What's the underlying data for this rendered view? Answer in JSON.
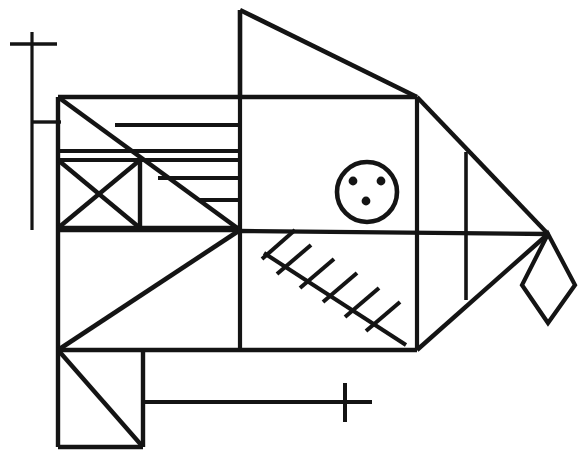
{
  "figure": {
    "title": "Fish line drawing",
    "canvas": {
      "width": 583,
      "height": 458,
      "background": "#ffffff"
    },
    "ink_color": "#141414",
    "stroke_width": 4.2,
    "thin_stroke_width": 3.2
  },
  "parts": {
    "mast": {
      "name": "vertical mast with crossbar",
      "vertical": [
        32,
        32,
        32,
        230
      ],
      "crossbar": [
        10,
        44,
        57,
        44
      ],
      "connector": [
        33,
        122,
        61,
        122
      ]
    },
    "dorsal_fin": {
      "name": "upper triangular fin",
      "vertical": [
        240,
        10,
        240,
        97
      ],
      "diagonal": [
        240,
        10,
        417,
        97
      ]
    },
    "eye": {
      "name": "circular eye",
      "cx": 367,
      "cy": 192,
      "r": 30,
      "dots": [
        {
          "cx": 353,
          "cy": 181,
          "r": 4.2
        },
        {
          "cx": 381,
          "cy": 181,
          "r": 4.2
        },
        {
          "cx": 366,
          "cy": 201,
          "r": 4.2
        }
      ]
    },
    "bone": {
      "name": "diagonal bone with ribs",
      "spine": [
        264,
        253,
        406,
        345
      ],
      "ribs": [
        [
          277,
          272,
          310,
          245
        ],
        [
          300,
          287,
          334,
          259
        ],
        [
          323,
          301,
          357,
          273
        ],
        [
          345,
          316,
          379,
          288
        ],
        [
          366,
          330,
          399,
          302
        ],
        [
          262,
          258,
          294,
          231
        ]
      ]
    },
    "tail": {
      "name": "diamond tail",
      "apex": [
        548,
        234
      ],
      "points": "548,234 573,284 548,322 523,284"
    },
    "marks": {
      "lower_cross": {
        "vertical": [
          345,
          383,
          345,
          422
        ],
        "horizontal": [
          319,
          402,
          372,
          402
        ]
      }
    },
    "body_outline": {
      "name": "main body polyline",
      "top_edge_y": 97,
      "left_edge_x": 58,
      "bottom_edge_y": 447
    }
  },
  "segments": [
    {
      "id": "mast-vert",
      "d": "M32,32 L32,230",
      "w": "thin"
    },
    {
      "id": "mast-cross",
      "d": "M10,44 L57,44",
      "w": "thin"
    },
    {
      "id": "mast-connector",
      "d": "M32,122 L61,122",
      "w": "thin"
    },
    {
      "id": "fin-vert",
      "d": "M240,10 L240,97",
      "w": "bold"
    },
    {
      "id": "fin-diag",
      "d": "M240,10 L417,97",
      "w": "bold"
    },
    {
      "id": "body-top",
      "d": "M58,97 L417,97",
      "w": "bold"
    },
    {
      "id": "head-left",
      "d": "M58,97 L58,447",
      "w": "bold"
    },
    {
      "id": "snout-diag-top",
      "d": "M58,97 L240,230",
      "w": "bold"
    },
    {
      "id": "snout-diag-bottom",
      "d": "M240,230 L58,350",
      "w": "bold"
    },
    {
      "id": "row1",
      "d": "M115,125 L240,125",
      "w": "bold"
    },
    {
      "id": "row2-a",
      "d": "M58,151 L240,151",
      "w": "bold"
    },
    {
      "id": "row2-b",
      "d": "M58,160 L240,160",
      "w": "bold"
    },
    {
      "id": "row3",
      "d": "M158,178 L240,178",
      "w": "bold"
    },
    {
      "id": "row4",
      "d": "M200,200 L240,200",
      "w": "bold"
    },
    {
      "id": "xbox-bottom",
      "d": "M58,228 L240,228",
      "w": "bold"
    },
    {
      "id": "xbox-right",
      "d": "M140,160 L140,228",
      "w": "bold"
    },
    {
      "id": "xbox-diag1",
      "d": "M58,160 L140,228",
      "w": "bold"
    },
    {
      "id": "xbox-diag2",
      "d": "M140,160 L58,228",
      "w": "bold"
    },
    {
      "id": "lower-shelf",
      "d": "M58,350 L417,350",
      "w": "bold"
    },
    {
      "id": "lower-box-right",
      "d": "M143,350 L143,447",
      "w": "bold"
    },
    {
      "id": "lower-box-bottom",
      "d": "M58,447 L143,447",
      "w": "bold"
    },
    {
      "id": "lower-box-diag",
      "d": "M58,350 L143,447",
      "w": "bold"
    },
    {
      "id": "lower-ledge",
      "d": "M143,402 L372,402",
      "w": "bold"
    },
    {
      "id": "mid-spine",
      "d": "M240,230 L548,234",
      "w": "bold"
    },
    {
      "id": "mid-left",
      "d": "M58,230 L240,230",
      "w": "bold"
    },
    {
      "id": "vert-240-up",
      "d": "M240,97 L240,230",
      "w": "bold"
    },
    {
      "id": "vert-240-down",
      "d": "M240,230 L240,350",
      "w": "bold"
    },
    {
      "id": "vert-417-up",
      "d": "M417,97 L417,232",
      "w": "bold"
    },
    {
      "id": "vert-417-down",
      "d": "M417,232 L417,350",
      "w": "bold"
    },
    {
      "id": "vert-466-up",
      "d": "M466,152 L466,233",
      "w": "bold"
    },
    {
      "id": "vert-466-down",
      "d": "M466,233 L466,300",
      "w": "bold"
    },
    {
      "id": "upper-right-diag",
      "d": "M417,97 L548,234",
      "w": "bold"
    },
    {
      "id": "lower-right-diag",
      "d": "M548,234 L417,350",
      "w": "bold"
    },
    {
      "id": "tail-upper-fold",
      "d": "M466,152 L417,97",
      "w": "bold"
    },
    {
      "id": "tail-lower-fold",
      "d": "M466,300 L417,350",
      "w": "bold"
    },
    {
      "id": "belly-diag",
      "d": "M417,350 L240,350",
      "w": "bold"
    },
    {
      "id": "tail-diamond",
      "d": "M548,234 L575,285 L548,323 L522,285 Z",
      "w": "bold"
    },
    {
      "id": "cross2-vert",
      "d": "M345,383 L345,422",
      "w": "bold"
    },
    {
      "id": "cross2-horz",
      "d": "M318,402 L372,402",
      "w": "bold"
    }
  ],
  "labels": {
    "alt_text": "Abstract geometric fish line drawing",
    "caption": ""
  }
}
